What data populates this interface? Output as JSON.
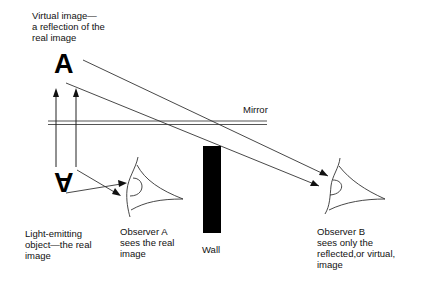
{
  "diagram": {
    "labels": {
      "virtual_image": "Virtual image—\na reflection of the\nreal image",
      "mirror": "Mirror",
      "light_object": "Light-emitting\nobject—the real\nimage",
      "observer_a": "Observer A\nsees the real\nimage",
      "wall": "Wall",
      "observer_b": "Observer B\nsees only the\nreflected,or virtual,\nimage"
    },
    "letters": {
      "virtual": "A",
      "real": "A"
    },
    "colors": {
      "ink": "#000000",
      "line": "#333333",
      "background": "#ffffff"
    }
  }
}
